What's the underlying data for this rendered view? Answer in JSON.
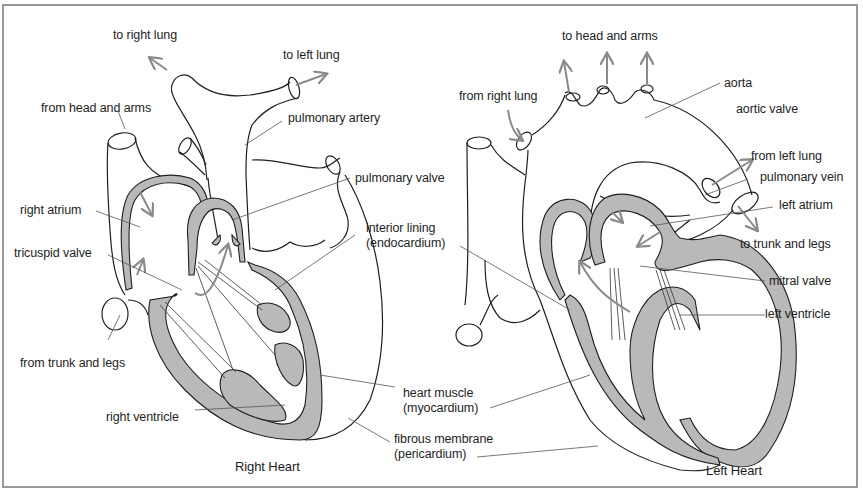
{
  "figure": {
    "colors": {
      "line": "#1f1f1f",
      "muscle": "#b9b9b9",
      "arrow": "#8a8a8a",
      "leader": "#555555",
      "frame": "#777777"
    },
    "right_heart": {
      "caption": "Right Heart",
      "labels": {
        "to_right_lung": "to right lung",
        "to_left_lung": "to left lung",
        "from_head_and_arms": "from head and arms",
        "pulmonary_artery": "pulmonary artery",
        "pulmonary_valve": "pulmonary valve",
        "right_atrium": "right atrium",
        "tricuspid_valve": "tricuspid valve",
        "interior_lining": "interior lining",
        "endocardium": "(endocardium)",
        "from_trunk_and_legs": "from trunk and legs",
        "right_ventricle": "right ventricle",
        "heart_muscle": "heart muscle",
        "myocardium": "(myocardium)",
        "fibrous_membrane": "fibrous membrane",
        "pericardium": "(pericardium)"
      }
    },
    "left_heart": {
      "caption": "Left Heart",
      "labels": {
        "to_head_and_arms": "to head and arms",
        "from_right_lung": "from right lung",
        "aorta": "aorta",
        "aortic_valve": "aortic valve",
        "from_left_lung": "from left lung",
        "pulmonary_vein": "pulmonary vein",
        "left_atrium": "left atrium",
        "to_trunk_and_legs": "to trunk and legs",
        "mitral_valve": "mitral valve",
        "left_ventricle": "left ventricle"
      }
    }
  }
}
